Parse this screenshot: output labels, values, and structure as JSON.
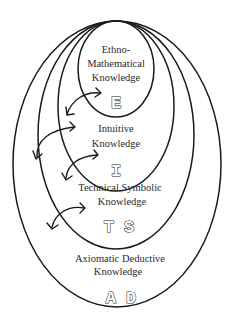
{
  "diagram": {
    "levels": [
      {
        "id": "ethno",
        "label_lines": [
          "Ethno-",
          "Mathematical",
          "Knowledge"
        ],
        "code": "E"
      },
      {
        "id": "intuitive",
        "label_lines": [
          "Intuitive",
          "Knowledge"
        ],
        "code": "I"
      },
      {
        "id": "technical",
        "label_lines": [
          "Technical Symbolic",
          "Knowledge"
        ],
        "code": "T S"
      },
      {
        "id": "axiomatic",
        "label_lines": [
          "Axiomatic Deductive",
          "Knowledge"
        ],
        "code": "A D"
      }
    ],
    "arrows": [
      {
        "from": "E",
        "to": "I",
        "type": "bidirectional"
      },
      {
        "from": "E",
        "to": "TS",
        "type": "bidirectional"
      },
      {
        "from": "I",
        "to": "TS",
        "type": "bidirectional"
      },
      {
        "from": "TS",
        "to": "AD",
        "type": "bidirectional"
      }
    ],
    "colors": {
      "line": "#1a1a1a",
      "text": "#2a2a2a",
      "background": "#ffffff"
    }
  }
}
